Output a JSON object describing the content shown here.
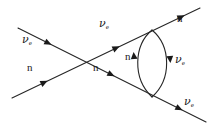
{
  "figure": {
    "type": "feynman-diagram",
    "background_color": "#ffffff",
    "line_color": "#262626",
    "text_color": "#191919"
  },
  "particles": {
    "neutrino": {
      "symbol": "ν",
      "subscript": "e",
      "name": "electron-neutrino"
    },
    "neutron": {
      "symbol": "n",
      "subscript": "",
      "name": "neutron"
    }
  },
  "labels": [
    {
      "id": "incoming-neutrino",
      "symbol": "ν",
      "subscript": "e",
      "x": 24,
      "y": 40
    },
    {
      "id": "incoming-neutron",
      "symbol": "n",
      "subscript": "",
      "x": 28,
      "y": 68
    },
    {
      "id": "mid-neutrino",
      "symbol": "ν",
      "subscript": "e",
      "x": 101,
      "y": 24
    },
    {
      "id": "mid-neutron",
      "symbol": "n",
      "subscript": "",
      "x": 94,
      "y": 68
    },
    {
      "id": "outgoing-neutron",
      "symbol": "n",
      "subscript": "",
      "x": 178,
      "y": 18
    },
    {
      "id": "loop-neutron",
      "symbol": "n",
      "subscript": "",
      "x": 128,
      "y": 56
    },
    {
      "id": "loop-neutrino",
      "symbol": "ν",
      "subscript": "e",
      "x": 166,
      "y": 60
    },
    {
      "id": "outgoing-neutrino",
      "symbol": "ν",
      "subscript": "e",
      "x": 176,
      "y": 98
    }
  ],
  "lines": [
    {
      "id": "neutrino-line",
      "description": "incoming electron-neutrino rising to upper right",
      "from": {
        "x": 18,
        "y": 92
      },
      "to": {
        "x": 200,
        "y": 8
      },
      "arrows": [
        {
          "x": 41,
          "y": 81,
          "label": "incoming-neutrino-arrow"
        },
        {
          "x": 113,
          "y": 48,
          "label": "mid-neutrino-arrow"
        },
        {
          "x": 178,
          "y": 17,
          "label": "outgoing-neutron-arrow"
        }
      ]
    },
    {
      "id": "neutron-line",
      "description": "incoming neutron descending to lower right",
      "from": {
        "x": 18,
        "y": 28
      },
      "to": {
        "x": 206,
        "y": 122
      },
      "arrows": [
        {
          "x": 45,
          "y": 41,
          "label": "incoming-neutron-arrow"
        },
        {
          "x": 108,
          "y": 73,
          "label": "mid-neutron-arrow"
        },
        {
          "x": 176,
          "y": 107,
          "label": "outgoing-neutrino-arrow"
        }
      ]
    }
  ],
  "loop": {
    "id": "self-energy-loop",
    "description": "closed bubble loop between the two vertices on the right",
    "top_vertex": {
      "x": 152,
      "y": 30
    },
    "bottom_vertex": {
      "x": 152,
      "y": 97
    },
    "left_bulge_x": 132,
    "right_bulge_x": 172,
    "arrows": [
      {
        "x": 134,
        "y": 57,
        "direction": "up",
        "label": "loop-neutron-arrow"
      },
      {
        "x": 170,
        "y": 57,
        "direction": "down",
        "label": "loop-neutrino-arrow"
      }
    ]
  },
  "vertices": [
    {
      "id": "crossing-vertex",
      "x": 80,
      "y": 62
    },
    {
      "id": "loop-top-vertex",
      "x": 152,
      "y": 30
    },
    {
      "id": "loop-bottom-vertex",
      "x": 152,
      "y": 97
    }
  ]
}
